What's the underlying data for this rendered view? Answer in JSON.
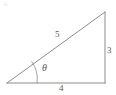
{
  "figure": {
    "name": "right-triangle-3-4-5",
    "background_color": "#ffffff",
    "stroke_color": "#8c8c8c",
    "label_color": "#5a5a5a",
    "watermark_text": "A",
    "labels": {
      "hypotenuse": "5",
      "vertical_leg": "3",
      "horizontal_leg": "4",
      "angle": "θ"
    },
    "geometry": {
      "left_vertex": [
        7,
        83
      ],
      "bottom_right_vertex": [
        105,
        83
      ],
      "top_right_vertex": [
        105,
        12
      ],
      "angle_arc_radius": 30
    }
  }
}
